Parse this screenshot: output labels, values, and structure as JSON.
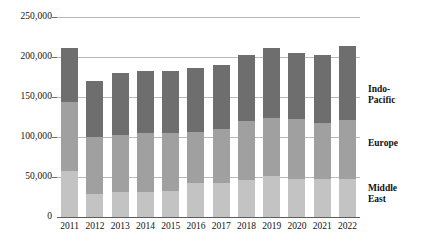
{
  "chart_data": {
    "type": "bar",
    "stacked": true,
    "title": "",
    "subtitle": "",
    "xlabel": "",
    "ylabel": "",
    "categories": [
      "2011",
      "2012",
      "2013",
      "2014",
      "2015",
      "2016",
      "2017",
      "2018",
      "2019",
      "2020",
      "2021",
      "2022"
    ],
    "ylim": [
      0,
      250000
    ],
    "yticks": [
      0,
      50000,
      100000,
      150000,
      200000,
      250000
    ],
    "ytick_labels": [
      "0",
      "50,000",
      "100,000",
      "150,000",
      "200,000",
      "250,000"
    ],
    "grid": true,
    "legend_position": "right-inline",
    "series": [
      {
        "name": "Middle East",
        "color": "#c3c3c3",
        "values": [
          58000,
          29000,
          31000,
          31000,
          32000,
          42000,
          43000,
          46000,
          51000,
          47000,
          47000,
          47000
        ]
      },
      {
        "name": "Europe",
        "color": "#a0a0a0",
        "values": [
          86000,
          71000,
          72000,
          74000,
          73000,
          64000,
          67000,
          74000,
          73000,
          75000,
          70000,
          74000
        ]
      },
      {
        "name": "Indo-Pacific",
        "color": "#6e6e6e",
        "values": [
          67000,
          70000,
          77000,
          78000,
          78000,
          80000,
          80000,
          82000,
          87000,
          83000,
          86000,
          93000
        ]
      }
    ],
    "totals": [
      211000,
      170000,
      180000,
      183000,
      183000,
      186000,
      190000,
      202000,
      211000,
      205000,
      203000,
      214000
    ]
  },
  "labels": {
    "indo_pacific": "Indo-\nPacific",
    "europe": "Europe",
    "middle_east": "Middle\nEast"
  }
}
